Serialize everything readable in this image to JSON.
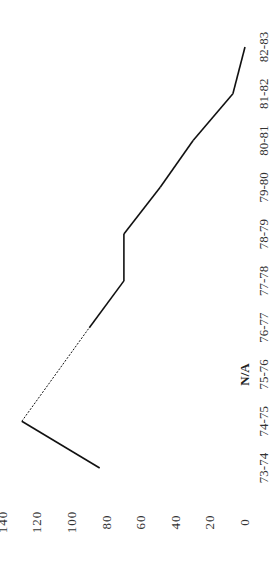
{
  "chart_data": {
    "type": "line",
    "orientation": "rotated-90-ccw",
    "title": "",
    "xlabel": "",
    "ylabel": "",
    "categories": [
      "73-74",
      "74-75",
      "75-76",
      "76-77",
      "77-78",
      "78-79",
      "79-80",
      "80-81",
      "81-82",
      "82-83"
    ],
    "series": [
      {
        "name": "series-1",
        "values": [
          84,
          129,
          null,
          90,
          70,
          70,
          49,
          30,
          7,
          0
        ]
      }
    ],
    "gap_style": "dashed line bridging missing 75-76 value",
    "annotations": [
      {
        "category": "75-76",
        "text": "N/A"
      }
    ],
    "yticks": [
      0,
      20,
      40,
      60,
      80,
      100,
      120,
      140
    ],
    "ylim": [
      0,
      140
    ],
    "grid": false,
    "legend": "none"
  },
  "labels": {
    "na": "N/A"
  }
}
